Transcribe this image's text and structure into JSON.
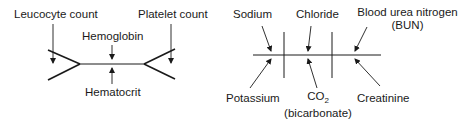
{
  "cbc_diagram": {
    "title": "Complete blood count shorthand",
    "labels": {
      "leucocyte": "Leucocyte count",
      "platelet": "Platelet count",
      "hemoglobin": "Hemoglobin",
      "hematocrit": "Hematocrit"
    }
  },
  "bmp_diagram": {
    "title": "Basic metabolic panel shorthand",
    "labels": {
      "sodium": "Sodium",
      "chloride": "Chloride",
      "bun_line1": "Blood urea nitrogen",
      "bun_line2": "(BUN)",
      "potassium": "Potassium",
      "co2_main": "CO",
      "co2_sub": "2",
      "co2_line2": "(bicarbonate)",
      "creatinine": "Creatinine"
    }
  },
  "colors": {
    "stroke": "#1a1a1a",
    "background": "#ffffff"
  }
}
